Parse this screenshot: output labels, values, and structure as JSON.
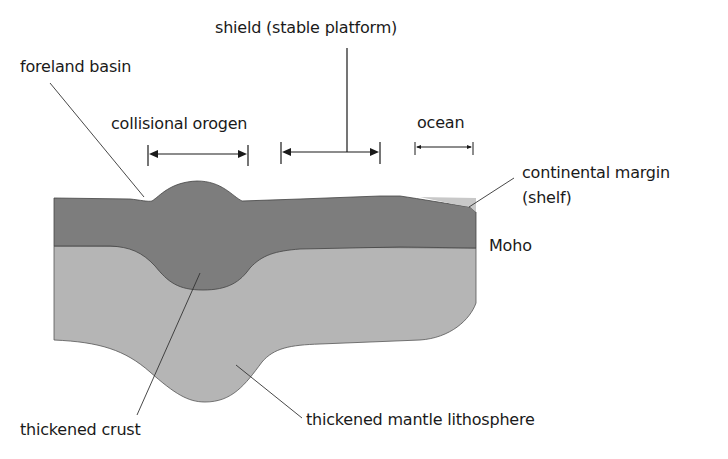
{
  "diagram": {
    "labels": {
      "shield": "shield (stable platform)",
      "foreland_basin": "foreland basin",
      "collisional_orogen": "collisional orogen",
      "ocean": "ocean",
      "continental_margin_line1": "continental margin",
      "continental_margin_line2": "(shelf)",
      "moho": "Moho",
      "thickened_crust": "thickened crust",
      "thickened_mantle_lithosphere": "thickened mantle lithosphere"
    },
    "colors": {
      "crust": "#7d7d7d",
      "mantle_lithosphere": "#b5b5b5",
      "shelf": "#c8c8c8",
      "outline": "#444444",
      "leader_line": "#333333",
      "background": "#ffffff"
    }
  }
}
